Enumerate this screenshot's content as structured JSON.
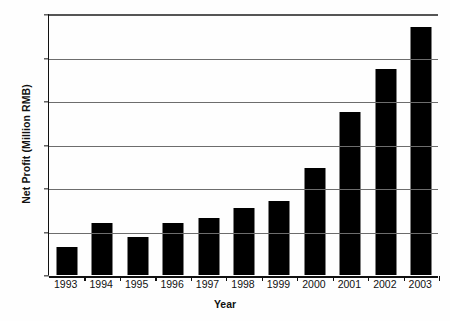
{
  "chart_data": {
    "type": "bar",
    "title": "",
    "subtitle": "",
    "xlabel": "Year",
    "ylabel": "Net Profit (Million RMB)",
    "categories": [
      "1993",
      "1994",
      "1995",
      "1996",
      "1997",
      "1998",
      "1999",
      "2000",
      "2001",
      "2002",
      "2003"
    ],
    "values": [
      13,
      24,
      17.5,
      24,
      26,
      31,
      34,
      49,
      75,
      94.5,
      114
    ],
    "series": [
      {
        "name": "Net Profit",
        "values": [
          13,
          24,
          17.5,
          24,
          26,
          31,
          34,
          49,
          75,
          94.5,
          114
        ]
      }
    ],
    "ylim": [
      0,
      120
    ],
    "yticks": [
      0,
      20,
      40,
      60,
      80,
      100,
      120
    ],
    "ytick_labels": [
      "0",
      "20",
      "40",
      "60",
      "80",
      "100",
      "120"
    ],
    "grid": true,
    "grid_axis": "y",
    "legend": false,
    "legend_position": "none",
    "bar_color": "#000000",
    "grid_color": "#6d6d6d",
    "axis_color": "#111111",
    "background_color": "#ffffff",
    "annotations": []
  }
}
